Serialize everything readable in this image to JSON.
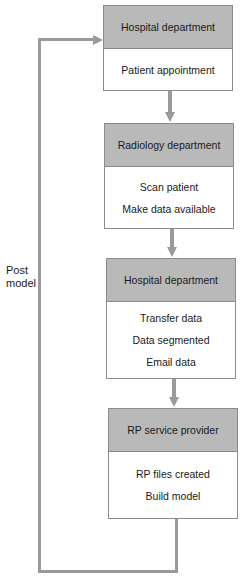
{
  "diagram": {
    "type": "flowchart",
    "boxes": [
      {
        "header": "Hospital department",
        "items": [
          "Patient appointment"
        ]
      },
      {
        "header": "Radiology department",
        "items": [
          "Scan patient",
          "Make data available"
        ]
      },
      {
        "header": "Hospital department",
        "items": [
          "Transfer data",
          "Data segmented",
          "Email data"
        ]
      },
      {
        "header": "RP service provider",
        "items": [
          "RP files created",
          "Build model"
        ]
      }
    ],
    "loop_label_line1": "Post",
    "loop_label_line2": "model"
  },
  "colors": {
    "header_fill": "#b9b9b9",
    "arrow": "#9a9a9a",
    "border": "#8c8c8c"
  }
}
